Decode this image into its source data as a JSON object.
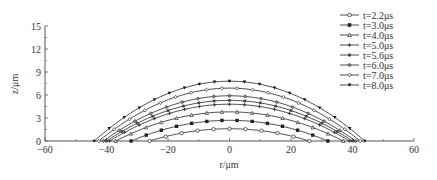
{
  "chart_data": {
    "type": "line",
    "title": "",
    "xlabel": "r/μm",
    "ylabel": "z/μm",
    "xlim": [
      -60,
      60
    ],
    "ylim": [
      0,
      15
    ],
    "xticks": [
      -60,
      -40,
      -20,
      0,
      20,
      40,
      60
    ],
    "yticks": [
      0,
      3,
      6,
      9,
      12,
      15
    ],
    "grid": false,
    "legend_position": "upper right",
    "series": [
      {
        "name": "t=2.2μs",
        "half_width": 26,
        "peak": 1.6,
        "marker": "circle-open"
      },
      {
        "name": "t=3.0μs",
        "half_width": 32,
        "peak": 2.7,
        "marker": "square-filled"
      },
      {
        "name": "t=4.0μs",
        "half_width": 37,
        "peak": 3.8,
        "marker": "triangle-open"
      },
      {
        "name": "t=5.0μs",
        "half_width": 39,
        "peak": 4.8,
        "marker": "cross"
      },
      {
        "name": "t=5.6μs",
        "half_width": 40,
        "peak": 5.3,
        "marker": "square-small"
      },
      {
        "name": "t=6.0μs",
        "half_width": 41,
        "peak": 5.9,
        "marker": "diamond-gray"
      },
      {
        "name": "t=7.0μs",
        "half_width": 42.5,
        "peak": 6.9,
        "marker": "diamond-open"
      },
      {
        "name": "t=8.0μs",
        "half_width": 44,
        "peak": 7.8,
        "marker": "triangle-down-filled"
      }
    ]
  }
}
